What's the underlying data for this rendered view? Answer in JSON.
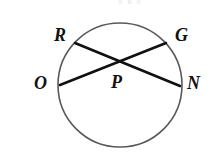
{
  "figure": {
    "type": "geometry-diagram",
    "background_color": "#ffffff",
    "circle": {
      "name": "circle-P",
      "center_x": 120,
      "center_y": 85,
      "radius": 62,
      "stroke_color": "#595959",
      "stroke_width": 1.6,
      "fill": "none"
    },
    "chords": [
      {
        "name": "chord-R-N",
        "from_label": "R",
        "to_label": "N",
        "x1": 75,
        "y1": 43,
        "x2": 180,
        "y2": 86,
        "stroke_color": "#111111",
        "stroke_width": 2.6
      },
      {
        "name": "chord-O-G",
        "from_label": "O",
        "to_label": "G",
        "x1": 60,
        "y1": 85,
        "x2": 166,
        "y2": 43,
        "stroke_color": "#111111",
        "stroke_width": 2.6
      }
    ],
    "intersection": {
      "name": "point-P",
      "label": "P",
      "x": 118,
      "y": 61
    },
    "labels": [
      {
        "id": "R",
        "text": "R",
        "x": 54,
        "y": 26,
        "role": "point-on-circle"
      },
      {
        "id": "G",
        "text": "G",
        "x": 175,
        "y": 26,
        "role": "point-on-circle"
      },
      {
        "id": "O",
        "text": "O",
        "x": 34,
        "y": 74,
        "role": "point-on-circle"
      },
      {
        "id": "N",
        "text": "N",
        "x": 187,
        "y": 74,
        "role": "point-on-circle"
      },
      {
        "id": "P",
        "text": "P",
        "x": 111,
        "y": 73,
        "role": "center-point"
      }
    ],
    "label_style": {
      "color": "#111111",
      "font_size": "18px",
      "italic": true,
      "bold": true
    }
  }
}
